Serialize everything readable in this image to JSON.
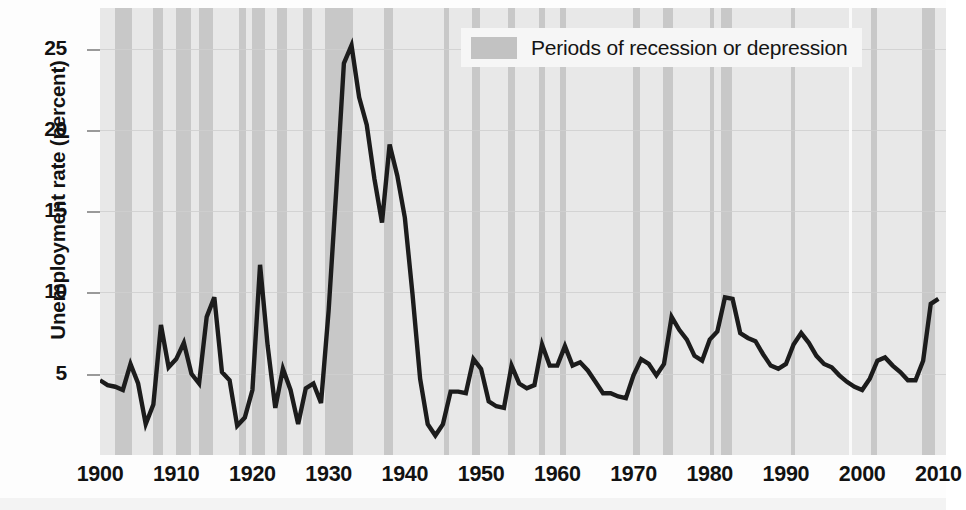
{
  "chart_data": {
    "type": "line",
    "title": "",
    "xlabel": "",
    "ylabel": "Unemployment rate (percent)",
    "xlim": [
      1900,
      2011
    ],
    "ylim": [
      0,
      27.5
    ],
    "yticks": [
      5,
      10,
      15,
      20,
      25
    ],
    "xticks": [
      1900,
      1910,
      1920,
      1930,
      1940,
      1950,
      1960,
      1970,
      1980,
      1990,
      2000,
      2010
    ],
    "grid": "horizontal",
    "legend_position": "top-right",
    "legend": [
      {
        "label": "Periods of recession or depression",
        "color": "#c8c8c8",
        "marker": "band"
      }
    ],
    "series": [
      {
        "name": "Unemployment rate",
        "color": "#1c1c1c",
        "x": [
          1900,
          1901,
          1902,
          1903,
          1904,
          1905,
          1906,
          1907,
          1908,
          1909,
          1910,
          1911,
          1912,
          1913,
          1914,
          1915,
          1916,
          1917,
          1918,
          1919,
          1920,
          1921,
          1922,
          1923,
          1924,
          1925,
          1926,
          1927,
          1928,
          1929,
          1930,
          1931,
          1932,
          1933,
          1934,
          1935,
          1936,
          1937,
          1938,
          1939,
          1940,
          1941,
          1942,
          1943,
          1944,
          1945,
          1946,
          1947,
          1948,
          1949,
          1950,
          1951,
          1952,
          1953,
          1954,
          1955,
          1956,
          1957,
          1958,
          1959,
          1960,
          1961,
          1962,
          1963,
          1964,
          1965,
          1966,
          1967,
          1968,
          1969,
          1970,
          1971,
          1972,
          1973,
          1974,
          1975,
          1976,
          1977,
          1978,
          1979,
          1980,
          1981,
          1982,
          1983,
          1984,
          1985,
          1986,
          1987,
          1988,
          1989,
          1990,
          1991,
          1992,
          1993,
          1994,
          1995,
          1996,
          1997,
          1998,
          1999,
          2000,
          2001,
          2002,
          2003,
          2004,
          2005,
          2006,
          2007,
          2008,
          2009,
          2010
        ],
        "y": [
          4.6,
          4.3,
          4.2,
          4.0,
          5.6,
          4.4,
          1.9,
          3.1,
          8.0,
          5.4,
          5.9,
          6.9,
          5.0,
          4.4,
          8.5,
          9.7,
          5.1,
          4.6,
          1.8,
          2.3,
          4.0,
          11.7,
          6.7,
          2.9,
          5.3,
          4.0,
          1.9,
          4.1,
          4.4,
          3.2,
          8.9,
          16.3,
          24.1,
          25.2,
          22.0,
          20.3,
          17.0,
          14.3,
          19.1,
          17.2,
          14.6,
          9.9,
          4.7,
          1.9,
          1.2,
          1.9,
          3.9,
          3.9,
          3.8,
          5.9,
          5.3,
          3.3,
          3.0,
          2.9,
          5.5,
          4.4,
          4.1,
          4.3,
          6.8,
          5.5,
          5.5,
          6.7,
          5.5,
          5.7,
          5.2,
          4.5,
          3.8,
          3.8,
          3.6,
          3.5,
          4.9,
          5.9,
          5.6,
          4.9,
          5.6,
          8.5,
          7.7,
          7.1,
          6.1,
          5.8,
          7.1,
          7.6,
          9.7,
          9.6,
          7.5,
          7.2,
          7.0,
          6.2,
          5.5,
          5.3,
          5.6,
          6.8,
          7.5,
          6.9,
          6.1,
          5.6,
          5.4,
          4.9,
          4.5,
          4.2,
          4.0,
          4.7,
          5.8,
          6.0,
          5.5,
          5.1,
          4.6,
          4.6,
          5.8,
          9.3,
          9.6
        ]
      }
    ],
    "recession_bands": [
      {
        "start": 1902.0,
        "end": 1904.2
      },
      {
        "start": 1907.0,
        "end": 1908.3
      },
      {
        "start": 1910.0,
        "end": 1912.0
      },
      {
        "start": 1913.0,
        "end": 1914.8
      },
      {
        "start": 1918.3,
        "end": 1919.2
      },
      {
        "start": 1920.0,
        "end": 1921.6
      },
      {
        "start": 1923.2,
        "end": 1924.5
      },
      {
        "start": 1926.6,
        "end": 1927.8
      },
      {
        "start": 1929.5,
        "end": 1933.2
      },
      {
        "start": 1937.3,
        "end": 1938.5
      },
      {
        "start": 1945.1,
        "end": 1945.8
      },
      {
        "start": 1948.8,
        "end": 1949.8
      },
      {
        "start": 1953.5,
        "end": 1954.4
      },
      {
        "start": 1957.6,
        "end": 1958.4
      },
      {
        "start": 1960.3,
        "end": 1961.2
      },
      {
        "start": 1969.9,
        "end": 1970.9
      },
      {
        "start": 1973.9,
        "end": 1975.2
      },
      {
        "start": 1980.1,
        "end": 1980.6
      },
      {
        "start": 1981.5,
        "end": 1982.9
      },
      {
        "start": 1990.6,
        "end": 1991.2
      },
      {
        "start": 2001.2,
        "end": 2001.9
      },
      {
        "start": 2007.9,
        "end": 2009.5
      }
    ]
  },
  "legend": {
    "label": "Periods of recession or depression"
  },
  "axes": {
    "y_title": "Unemployment rate (percent)",
    "y_ticks": [
      "25",
      "20",
      "15",
      "10",
      "5"
    ],
    "x_ticks": [
      "1900",
      "1910",
      "1920",
      "1930",
      "1940",
      "1950",
      "1960",
      "1970",
      "1980",
      "1990",
      "2000",
      "2010"
    ]
  },
  "colors": {
    "line": "#1c1c1c",
    "band": "#c8c8c8",
    "plot_background": "#e8e8e8",
    "gridline": "#cfcfcf",
    "text": "#121212"
  }
}
